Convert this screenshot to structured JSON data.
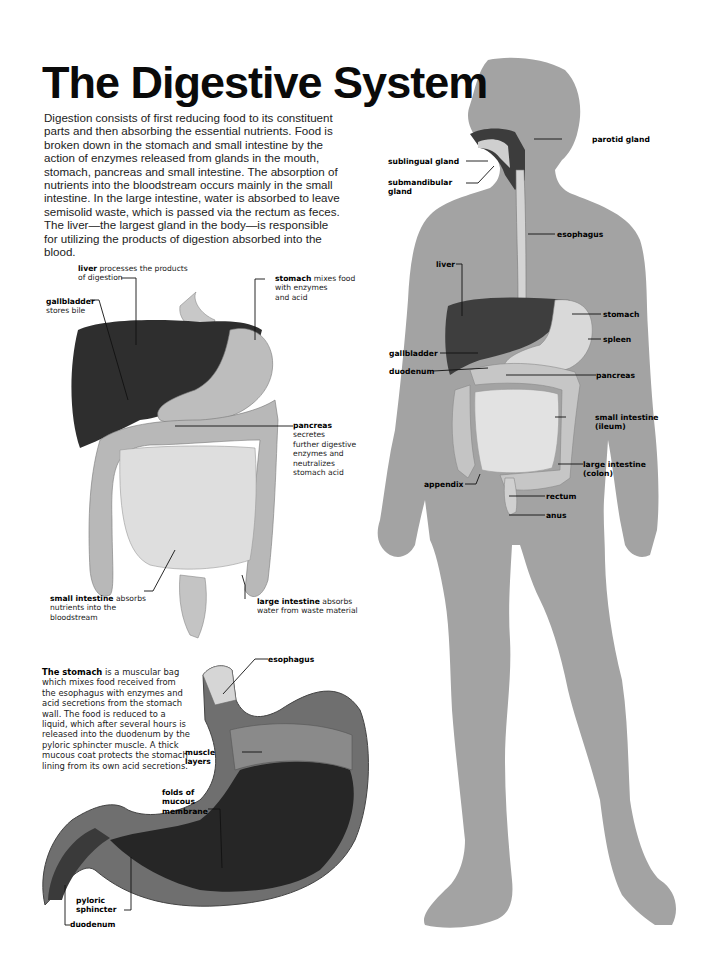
{
  "title": "The Digestive System",
  "intro": "Digestion consists of first reducing food to its constituent parts and then absorbing the essential nutrients. Food is broken down in the stomach and small intestine by the action of enzymes released from glands in the mouth, stomach, pancreas and small intestine. The absorption of nutrients into the bloodstream occurs mainly in the small intestine. In the large intestine, water is absorbed to leave semisolid waste, which is passed via the rectum as feces. The liver—the largest gland in the body—is responsible for utilizing the products of digestion absorbed into the blood.",
  "organs_diagram": {
    "labels": {
      "liver": {
        "term": "liver",
        "desc_1": " processes the products",
        "desc_2": "of digestion"
      },
      "gallbladder": {
        "term": "gallbladder",
        "desc": "stores bile"
      },
      "stomach": {
        "term": "stomach",
        "desc_1": " mixes food",
        "desc_2": "with enzymes",
        "desc_3": "and acid"
      },
      "pancreas": {
        "term": "pancreas",
        "desc_1": "secretes",
        "desc_2": "further digestive",
        "desc_3": "enzymes and",
        "desc_4": "neutralizes",
        "desc_5": "stomach acid"
      },
      "small_intestine": {
        "term": "small intestine",
        "desc_1": " absorbs",
        "desc_2": "nutrients into the",
        "desc_3": "bloodstream"
      },
      "large_intestine": {
        "term": "large intestine",
        "desc_1": " absorbs",
        "desc_2": "water from waste material"
      }
    }
  },
  "stomach_diagram": {
    "note_term": "The stomach",
    "note_text": " is a muscular bag which mixes food received from the esophagus with enzymes and acid secretions from the stomach wall. The food is reduced to a liquid, which after several hours is released into the duodenum by the pyloric sphincter muscle. A thick mucous coat protects the stomach lining from its own acid secretions.",
    "labels": {
      "esophagus": "esophagus",
      "muscle_1": "muscle",
      "muscle_2": "layers",
      "folds_1": "folds of",
      "folds_2": "mucous",
      "folds_3": "membrane",
      "pyloric_1": "pyloric",
      "pyloric_2": "sphincter",
      "duodenum": "duodenum"
    }
  },
  "body_diagram": {
    "labels": {
      "parotid_gland": "parotid gland",
      "sublingual_gland": "sublingual gland",
      "submandibular_1": "submandibular",
      "submandibular_2": "gland",
      "esophagus": "esophagus",
      "liver": "liver",
      "stomach": "stomach",
      "spleen": "spleen",
      "gallbladder": "gallbladder",
      "duodenum": "duodenum",
      "pancreas": "pancreas",
      "small_intestine_1": "small intestine",
      "small_intestine_2": "(ileum)",
      "large_intestine_1": "large intestine",
      "large_intestine_2": "(colon)",
      "appendix": "appendix",
      "rectum": "rectum",
      "anus": "anus"
    }
  },
  "colors": {
    "silhouette": "#a3a3a3",
    "liver": "#3a3a3a",
    "organ_light": "#d8d8d8",
    "organ_mid": "#b8b8b8",
    "stomach_dark": "#2e2e2e"
  }
}
